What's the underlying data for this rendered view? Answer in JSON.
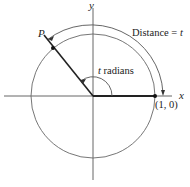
{
  "diagram": {
    "labels": {
      "x_axis": "x",
      "y_axis": "y",
      "point_p": "P",
      "point_start": "(1, 0)",
      "angle": "t radians",
      "distance_prefix": "Distance = ",
      "distance_var": "t"
    },
    "colors": {
      "stroke": "#555555",
      "heavy": "#222222",
      "background": "#ffffff"
    }
  }
}
